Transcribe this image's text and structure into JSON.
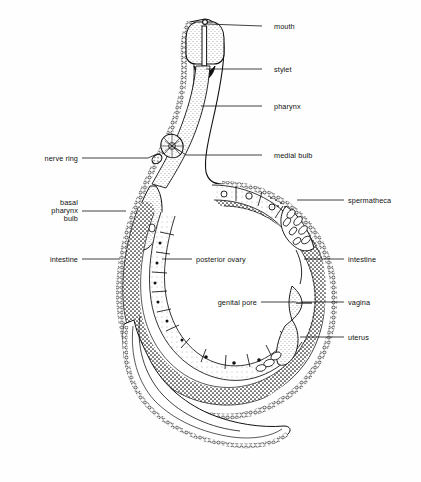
{
  "figure": {
    "background_color": "#fefefe",
    "ink_color": "#111111",
    "organism": "nematode"
  },
  "labels": {
    "right": [
      {
        "id": "mouth",
        "text": "mouth",
        "text_x": 274,
        "text_y": 29,
        "leader": [
          [
            262,
            26
          ],
          [
            207,
            24
          ]
        ]
      },
      {
        "id": "stylet",
        "text": "stylet",
        "text_x": 274,
        "text_y": 72,
        "leader": [
          [
            262,
            69
          ],
          [
            206,
            69
          ]
        ]
      },
      {
        "id": "pharynx",
        "text": "pharynx",
        "text_x": 274,
        "text_y": 109,
        "leader": [
          [
            262,
            106
          ],
          [
            201,
            106
          ]
        ]
      },
      {
        "id": "medial-bulb",
        "text": "medial bulb",
        "text_x": 274,
        "text_y": 158,
        "leader": [
          [
            262,
            155
          ],
          [
            186,
            155
          ],
          [
            172,
            146
          ]
        ]
      },
      {
        "id": "spermatheca",
        "text": "spermatheca",
        "text_x": 348,
        "text_y": 203,
        "leader": [
          [
            344,
            200
          ],
          [
            297,
            200
          ]
        ]
      },
      {
        "id": "intestine-r",
        "text": "intestine",
        "text_x": 348,
        "text_y": 262,
        "leader": [
          [
            344,
            259
          ],
          [
            304,
            259
          ]
        ]
      },
      {
        "id": "vagina",
        "text": "vagina",
        "text_x": 348,
        "text_y": 305,
        "leader": [
          [
            344,
            302
          ],
          [
            302,
            302
          ]
        ]
      },
      {
        "id": "uterus",
        "text": "uterus",
        "text_x": 348,
        "text_y": 340,
        "leader": [
          [
            344,
            337
          ],
          [
            300,
            337
          ]
        ]
      }
    ],
    "left": [
      {
        "id": "nerve-ring",
        "text": "nerve ring",
        "text_x": 78,
        "text_y": 161,
        "leader": [
          [
            82,
            158
          ],
          [
            147,
            158
          ],
          [
            155,
            152
          ]
        ]
      },
      {
        "id": "intestine-l",
        "text": "intestine",
        "text_x": 78,
        "text_y": 262,
        "leader": [
          [
            82,
            259
          ],
          [
            118,
            259
          ]
        ]
      }
    ],
    "left_block": {
      "id": "basal-pharynx-bulb",
      "lines": [
        "basal",
        "pharynx",
        "bulb"
      ],
      "text_x": 78,
      "line_y": [
        205,
        213,
        221
      ],
      "leader": [
        [
          82,
          211
        ],
        [
          124,
          211
        ]
      ]
    },
    "inner": [
      {
        "id": "posterior-ovary",
        "text": "posterior ovary",
        "text_x": 196,
        "text_y": 262,
        "anchor": "start",
        "leader": [
          [
            192,
            259
          ],
          [
            162,
            259
          ]
        ]
      },
      {
        "id": "genital-pore",
        "text": "genital pore",
        "text_x": 257,
        "text_y": 305,
        "anchor": "end",
        "leader": [
          [
            261,
            302
          ],
          [
            296,
            302
          ]
        ]
      }
    ]
  },
  "structures": {
    "head": "anterior head with mouth opening and protrusible stylet",
    "pharynx": "long tubular pharynx with medial bulb and basal pharynx bulb",
    "nerve_ring": "nerve ring encircling pharynx",
    "intestine": "stippled intestine running along body",
    "ovary": "posterior ovary with segmented oocytes bearing nuclei",
    "spermatheca": "spermatheca with packed sperm cells",
    "uterus": "uterus with eggs",
    "vagina": "vagina opening at genital pore",
    "tail": "tapering curved tail"
  }
}
